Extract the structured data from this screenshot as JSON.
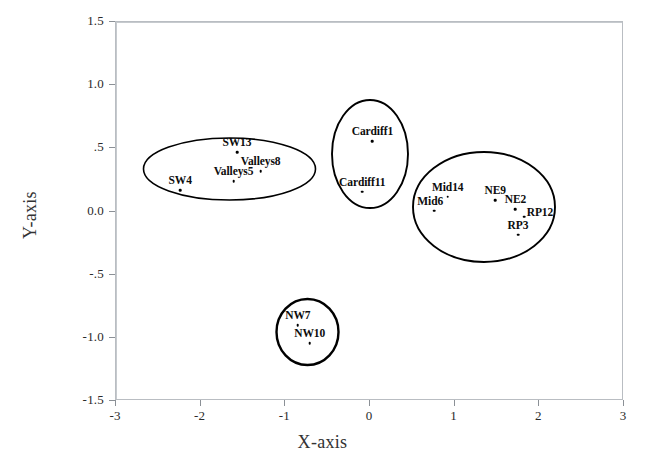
{
  "chart_data": {
    "type": "scatter",
    "title": "",
    "xlabel": "X-axis",
    "ylabel": "Y-axis",
    "xlim": [
      -3,
      3
    ],
    "ylim": [
      -1.5,
      1.5
    ],
    "grid": false,
    "legend": "none",
    "zero_lines": true,
    "xticks": [
      -3,
      -2,
      -1,
      0,
      1,
      2,
      3
    ],
    "xticklabels": [
      "-3",
      "-2",
      "-1",
      "0",
      "1",
      "2",
      "3"
    ],
    "yticks": [
      1.5,
      1.0,
      0.5,
      0.0,
      -0.5,
      -1.0,
      -1.5
    ],
    "yticklabels": [
      "1.5",
      "1.0",
      ".5",
      "0.0",
      "-.5",
      "-1.0",
      "-1.5"
    ],
    "points": [
      {
        "label": "SW13",
        "x": -1.56,
        "y": 0.46,
        "label_dx": 0,
        "label_dy": -4
      },
      {
        "label": "Valleys8",
        "x": -1.28,
        "y": 0.31,
        "label_dx": 0,
        "label_dy": -4
      },
      {
        "label": "Valleys5",
        "x": -1.6,
        "y": 0.23,
        "label_dx": 0,
        "label_dy": -4
      },
      {
        "label": "SW4",
        "x": -2.23,
        "y": 0.16,
        "label_dx": 0,
        "label_dy": -4
      },
      {
        "label": "Cardiff1",
        "x": 0.04,
        "y": 0.55,
        "label_dx": 0,
        "label_dy": -4
      },
      {
        "label": "Cardiff11",
        "x": -0.08,
        "y": 0.15,
        "label_dx": 0,
        "label_dy": -4
      },
      {
        "label": "Mid14",
        "x": 0.93,
        "y": 0.11,
        "label_dx": 0,
        "label_dy": -4
      },
      {
        "label": "Mid6",
        "x": 0.77,
        "y": 0.0,
        "label_dx": -4,
        "label_dy": -4
      },
      {
        "label": "NE9",
        "x": 1.49,
        "y": 0.08,
        "label_dx": 0,
        "label_dy": -4
      },
      {
        "label": "NE2",
        "x": 1.73,
        "y": 0.01,
        "label_dx": 0,
        "label_dy": -4
      },
      {
        "label": "RP12",
        "x": 1.83,
        "y": -0.05,
        "label_dx": 16,
        "label_dy": 1
      },
      {
        "label": "RP3",
        "x": 1.76,
        "y": -0.19,
        "label_dx": 0,
        "label_dy": -4
      },
      {
        "label": "NW7",
        "x": -0.84,
        "y": -0.91,
        "label_dx": 0,
        "label_dy": -4
      },
      {
        "label": "NW10",
        "x": -0.7,
        "y": -1.05,
        "label_dx": 0,
        "label_dy": -4
      }
    ],
    "clusters": [
      {
        "name": "sw-valleys-cluster",
        "cx": 229.5,
        "cy": 169,
        "rx": 86,
        "ry": 31,
        "stroke_width": 1.6
      },
      {
        "name": "cardiff-cluster",
        "cx": 370,
        "cy": 154,
        "rx": 38,
        "ry": 54,
        "stroke_width": 1.9
      },
      {
        "name": "mid-ne-rp-cluster",
        "cx": 484,
        "cy": 207,
        "rx": 71,
        "ry": 55,
        "stroke_width": 1.9
      },
      {
        "name": "nw-cluster",
        "cx": 307.5,
        "cy": 332,
        "rx": 31,
        "ry": 33,
        "stroke_width": 2.4
      }
    ]
  },
  "colors": {
    "point": "#000000",
    "ellipse": "#000000",
    "axis": "#b9bdc2",
    "zero_line": "#c6cace",
    "background": "#ffffff"
  }
}
